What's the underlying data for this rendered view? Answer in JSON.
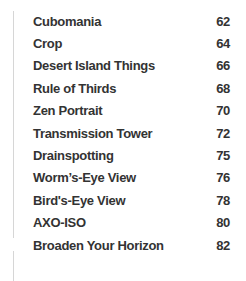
{
  "page": {
    "background_color": "#ffffff",
    "text_color": "#333333",
    "edge_line_color": "#d6d6d6"
  },
  "toc": {
    "entries": [
      {
        "title": "Cubomania",
        "page": "62"
      },
      {
        "title": "Crop",
        "page": "64"
      },
      {
        "title": "Desert Island Things",
        "page": "66"
      },
      {
        "title": "Rule of Thirds",
        "page": "68"
      },
      {
        "title": "Zen Portrait",
        "page": "70"
      },
      {
        "title": "Transmission Tower",
        "page": "72"
      },
      {
        "title": "Drainspotting",
        "page": "75"
      },
      {
        "title": "Worm’s-Eye View",
        "page": "76"
      },
      {
        "title": "Bird's-Eye View",
        "page": "78"
      },
      {
        "title": "AXO-ISO",
        "page": "80"
      },
      {
        "title": "Broaden Your Horizon",
        "page": "82"
      }
    ]
  }
}
